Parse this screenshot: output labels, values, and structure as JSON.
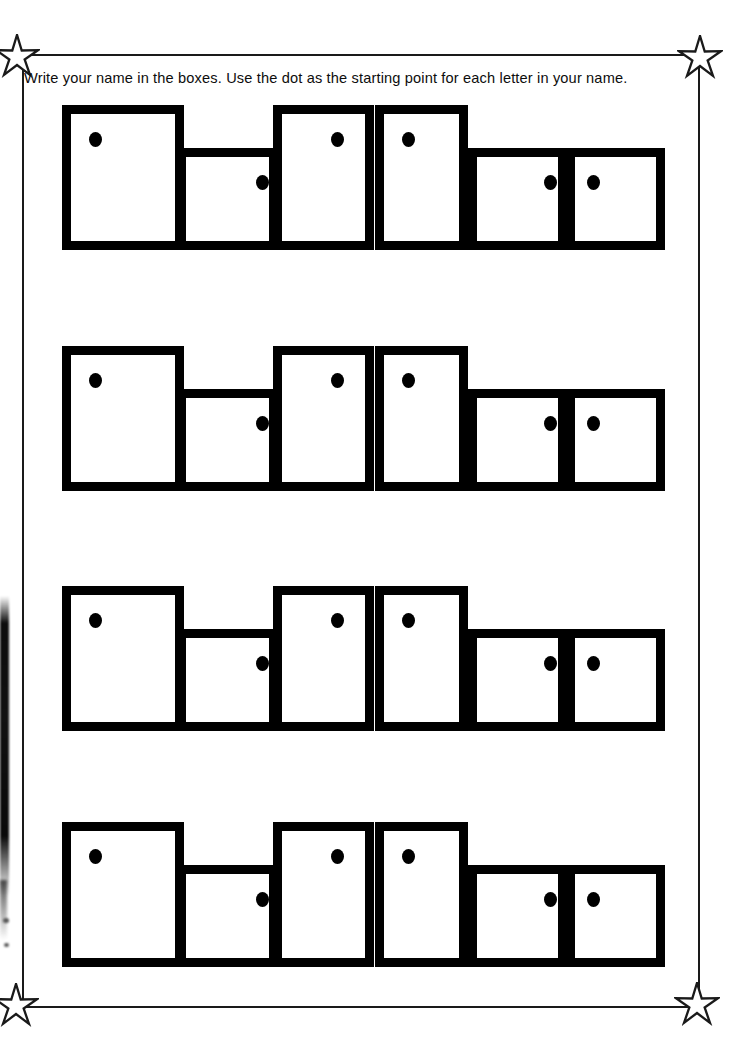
{
  "worksheet": {
    "instruction": "Write your name in the boxes. Use the dot as the starting point for each letter in your name.",
    "ink_color": "#000000",
    "frame_color": "#1a1a1a",
    "page_background": "#ffffff",
    "corner_star_icon": "star-icon",
    "corner_stars": [
      {
        "name": "star-top-left",
        "x": 17,
        "y": 57
      },
      {
        "name": "star-top-right",
        "x": 700,
        "y": 58
      },
      {
        "name": "star-bottom-left",
        "x": 16,
        "y": 1006
      },
      {
        "name": "star-bottom-right",
        "x": 697,
        "y": 1005
      }
    ],
    "row_count": 4,
    "boxes_per_row": 6,
    "rows": [
      {
        "name": "practice-row-1",
        "top": 105,
        "baseline": 250
      },
      {
        "name": "practice-row-2",
        "top": 346,
        "baseline": 491
      },
      {
        "name": "practice-row-3",
        "top": 586,
        "baseline": 731
      },
      {
        "name": "practice-row-4",
        "top": 822,
        "baseline": 967
      }
    ],
    "box_template": [
      {
        "index": 1,
        "size": "tall",
        "left": 62,
        "width": 122,
        "height": 145,
        "dot_position": "top-left",
        "dot_x": 18,
        "dot_y": 18
      },
      {
        "index": 2,
        "size": "short",
        "left": 177,
        "width": 101,
        "height": 102,
        "dot_position": "top-right",
        "dot_x": 70,
        "dot_y": 18
      },
      {
        "index": 3,
        "size": "tall",
        "left": 273,
        "width": 101,
        "height": 145,
        "dot_position": "top-center",
        "dot_x": 49,
        "dot_y": 18
      },
      {
        "index": 4,
        "size": "tall",
        "left": 375,
        "width": 93,
        "height": 145,
        "dot_position": "top-left",
        "dot_x": 18,
        "dot_y": 18
      },
      {
        "index": 5,
        "size": "short",
        "left": 468,
        "width": 99,
        "height": 102,
        "dot_position": "top-right",
        "dot_x": 67,
        "dot_y": 18
      },
      {
        "index": 6,
        "size": "short",
        "left": 566,
        "width": 99,
        "height": 102,
        "dot_position": "top-left",
        "dot_x": 12,
        "dot_y": 18
      }
    ],
    "scan_artifact": {
      "name": "scan-edge-artifact",
      "specks": [
        {
          "x": 3,
          "y": 918,
          "w": 6,
          "h": 5
        },
        {
          "x": 4,
          "y": 943,
          "w": 5,
          "h": 4
        }
      ]
    }
  }
}
